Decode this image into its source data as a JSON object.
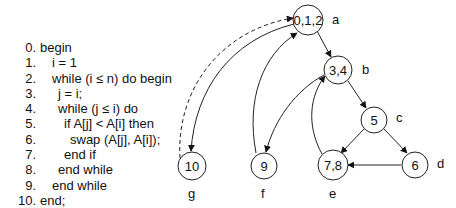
{
  "code": {
    "lines": [
      {
        "num": "0.",
        "indent": 0,
        "text": "begin"
      },
      {
        "num": "1.",
        "indent": 2,
        "text": "i = 1"
      },
      {
        "num": "2.",
        "indent": 2,
        "text": "while (i ≤ n) do begin"
      },
      {
        "num": "3.",
        "indent": 3,
        "text": "j = i;"
      },
      {
        "num": "4.",
        "indent": 3,
        "text": "while (j ≤ i) do"
      },
      {
        "num": "5.",
        "indent": 4,
        "text": "if A[j] < A[i] then"
      },
      {
        "num": "6.",
        "indent": 5,
        "text": "swap (A[j], A[i]);"
      },
      {
        "num": "7.",
        "indent": 4,
        "text": "end if"
      },
      {
        "num": "8.",
        "indent": 3,
        "text": "end while"
      },
      {
        "num": "9.",
        "indent": 2,
        "text": "end while"
      },
      {
        "num": "10.",
        "indent": 0,
        "text": "end;"
      }
    ]
  },
  "graph": {
    "nodes": [
      {
        "id": "a",
        "label": "0,1,2",
        "name": "a"
      },
      {
        "id": "b",
        "label": "3,4",
        "name": "b"
      },
      {
        "id": "c",
        "label": "5",
        "name": "c"
      },
      {
        "id": "d",
        "label": "6",
        "name": "d"
      },
      {
        "id": "e",
        "label": "7,8",
        "name": "e"
      },
      {
        "id": "f",
        "label": "9",
        "name": "f"
      },
      {
        "id": "g",
        "label": "10",
        "name": "g"
      }
    ],
    "edges": [
      {
        "from": "a",
        "to": "b",
        "style": "solid"
      },
      {
        "from": "b",
        "to": "c",
        "style": "solid"
      },
      {
        "from": "c",
        "to": "e",
        "style": "solid"
      },
      {
        "from": "c",
        "to": "d",
        "style": "solid"
      },
      {
        "from": "d",
        "to": "e",
        "style": "solid"
      },
      {
        "from": "e",
        "to": "b",
        "style": "solid"
      },
      {
        "from": "b",
        "to": "f",
        "style": "solid"
      },
      {
        "from": "f",
        "to": "a",
        "style": "solid"
      },
      {
        "from": "a",
        "to": "g",
        "style": "solid"
      },
      {
        "from": "g",
        "to": "a",
        "style": "dashed"
      }
    ]
  }
}
